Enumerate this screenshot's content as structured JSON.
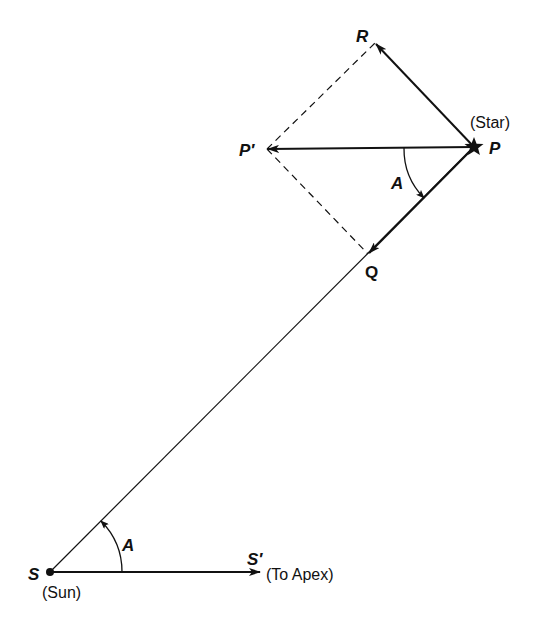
{
  "diagram": {
    "type": "vector-geometry",
    "colors": {
      "ink": "#111111",
      "background": "#ffffff"
    },
    "points": {
      "S": {
        "label": "S",
        "note": "(Sun)"
      },
      "S_prime": {
        "label": "S′",
        "note": "(To Apex)"
      },
      "P": {
        "label": "P",
        "note": "(Star)"
      },
      "P_prime": {
        "label": "P′"
      },
      "Q": {
        "label": "Q"
      },
      "R": {
        "label": "R"
      }
    },
    "angles": [
      {
        "label": "A",
        "location": "at S between SS′ and SP"
      },
      {
        "label": "A",
        "location": "at P between PP′ and PQ"
      }
    ],
    "vectors": [
      {
        "from": "S",
        "to": "S′",
        "style": "solid-arrow"
      },
      {
        "from": "P",
        "to": "P′",
        "style": "solid-arrow"
      },
      {
        "from": "P",
        "to": "Q",
        "style": "solid-arrow"
      },
      {
        "from": "P",
        "to": "R",
        "style": "solid-arrow"
      }
    ],
    "lines": [
      {
        "from": "S",
        "to": "P",
        "style": "thin-solid"
      },
      {
        "from": "P′",
        "to": "R",
        "style": "dashed"
      },
      {
        "from": "P′",
        "to": "Q",
        "style": "dashed"
      }
    ]
  }
}
